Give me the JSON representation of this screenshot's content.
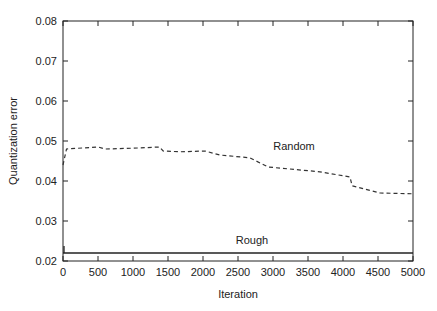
{
  "chart_data": {
    "type": "line",
    "title": "",
    "xlabel": "Iteration",
    "ylabel": "Quantization error",
    "xlim": [
      0,
      5000
    ],
    "ylim": [
      0.02,
      0.08
    ],
    "xticks": [
      0,
      500,
      1000,
      1500,
      2000,
      2500,
      3000,
      3500,
      4000,
      4500,
      5000
    ],
    "yticks": [
      0.02,
      0.03,
      0.04,
      0.05,
      0.06,
      0.07,
      0.08
    ],
    "xtick_labels": [
      "0",
      "500",
      "1000",
      "1500",
      "2000",
      "2500",
      "3000",
      "3500",
      "4000",
      "4500",
      "5000"
    ],
    "ytick_labels": [
      "0.02",
      "0.03",
      "0.04",
      "0.05",
      "0.06",
      "0.07",
      "0.08"
    ],
    "grid": false,
    "legend": "none (inline annotations)",
    "series": [
      {
        "name": "Random",
        "style": "dashed",
        "x": [
          0,
          50,
          500,
          600,
          1000,
          1380,
          1430,
          1670,
          2030,
          2240,
          2670,
          2930,
          3240,
          3670,
          4100,
          4130,
          4530,
          5000
        ],
        "y": [
          0.044,
          0.048,
          0.0485,
          0.048,
          0.0482,
          0.0485,
          0.0475,
          0.0473,
          0.0475,
          0.0465,
          0.0458,
          0.0435,
          0.043,
          0.0423,
          0.041,
          0.0388,
          0.037,
          0.0368
        ]
      },
      {
        "name": "Rough",
        "style": "solid",
        "x": [
          0,
          5000
        ],
        "y": [
          0.022,
          0.022
        ]
      }
    ],
    "annotations": [
      {
        "text": "Random",
        "x": 3300,
        "y": 0.0478
      },
      {
        "text": "Rough",
        "x": 2700,
        "y": 0.0243
      }
    ]
  }
}
